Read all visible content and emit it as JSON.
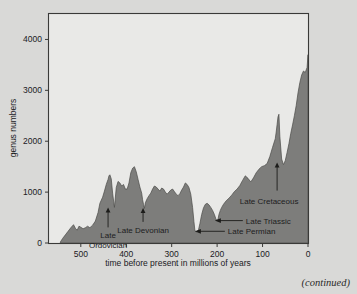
{
  "figure": {
    "caption_note": "(continued)",
    "background_color": "#d9d9d7",
    "plot_background_color": "#e9e9e7",
    "curve_fill_color": "#7d7d7b"
  },
  "chart_data": {
    "type": "area",
    "title": "",
    "xlabel": "time before present in millions of years",
    "ylabel": "genus numbers",
    "xlim": [
      570,
      0
    ],
    "ylim": [
      0,
      4500
    ],
    "x_reversed": true,
    "grid": false,
    "legend": null,
    "xticks": [
      500,
      400,
      300,
      200,
      100,
      0
    ],
    "xtick_labels": [
      "500",
      "400",
      "300",
      "200",
      "100",
      "0"
    ],
    "yticks": [
      0,
      1000,
      2000,
      3000,
      4000
    ],
    "ytick_labels": [
      "0",
      "1000",
      "2000",
      "3000",
      "4000"
    ],
    "series_name": "marine animal genus diversity",
    "x": [
      545,
      540,
      534,
      528,
      522,
      516,
      512,
      508,
      504,
      500,
      495,
      490,
      485,
      480,
      474,
      468,
      462,
      458,
      452,
      448,
      444,
      440,
      438,
      436,
      433,
      430,
      426,
      422,
      418,
      414,
      410,
      406,
      402,
      398,
      394,
      390,
      386,
      382,
      378,
      374,
      370,
      366,
      364,
      362,
      360,
      358,
      354,
      350,
      346,
      342,
      338,
      334,
      330,
      326,
      322,
      318,
      314,
      310,
      306,
      302,
      298,
      294,
      290,
      286,
      282,
      278,
      274,
      270,
      266,
      262,
      258,
      254,
      251,
      249,
      247,
      245,
      243,
      241,
      238,
      234,
      230,
      226,
      222,
      218,
      214,
      210,
      206,
      203,
      200,
      198,
      196,
      193,
      190,
      186,
      180,
      174,
      168,
      162,
      156,
      150,
      144,
      138,
      132,
      126,
      120,
      114,
      108,
      102,
      96,
      90,
      84,
      78,
      72,
      70,
      68,
      66,
      64,
      62,
      58,
      54,
      50,
      46,
      42,
      38,
      34,
      30,
      26,
      22,
      18,
      14,
      10,
      6,
      2,
      0
    ],
    "y": [
      20,
      90,
      160,
      230,
      300,
      360,
      290,
      250,
      330,
      310,
      280,
      300,
      330,
      300,
      350,
      430,
      600,
      780,
      900,
      1020,
      1150,
      1250,
      1320,
      1340,
      1260,
      980,
      700,
      1090,
      1210,
      1180,
      1120,
      1150,
      1060,
      1060,
      1180,
      1380,
      1470,
      1500,
      1400,
      1250,
      1100,
      980,
      850,
      760,
      680,
      790,
      870,
      930,
      980,
      1060,
      1120,
      1100,
      1060,
      1020,
      1080,
      1060,
      1000,
      960,
      1000,
      1040,
      1060,
      1010,
      960,
      930,
      970,
      1040,
      1100,
      1180,
      1150,
      1090,
      960,
      700,
      420,
      250,
      230,
      220,
      230,
      260,
      380,
      560,
      690,
      760,
      780,
      750,
      700,
      640,
      560,
      480,
      430,
      470,
      560,
      640,
      700,
      760,
      830,
      880,
      940,
      1010,
      1060,
      1130,
      1230,
      1320,
      1270,
      1200,
      1280,
      1380,
      1450,
      1500,
      1520,
      1560,
      1700,
      1880,
      2050,
      2180,
      2330,
      2480,
      2530,
      2100,
      1650,
      1540,
      1620,
      1780,
      1950,
      2150,
      2320,
      2500,
      2700,
      2950,
      3150,
      3300,
      3380,
      3350,
      3450,
      3700,
      3950,
      4150,
      4300
    ],
    "annotations": [
      {
        "id": "late-ordovician",
        "label": "Late Ordovician",
        "label_lines": [
          "Late",
          "Ordovician"
        ],
        "x_ma": 440,
        "y_value": 700,
        "arrow": "up"
      },
      {
        "id": "late-devonian",
        "label": "Late Devonian",
        "label_lines": [
          "Late Devonian"
        ],
        "x_ma": 363,
        "y_value": 690,
        "arrow": "up"
      },
      {
        "id": "late-permian",
        "label": "Late Permian",
        "label_lines": [
          "Late Permian"
        ],
        "x_ma": 249,
        "y_value": 230,
        "arrow": "left"
      },
      {
        "id": "late-triassic",
        "label": "Late Triassic",
        "label_lines": [
          "Late Triassic"
        ],
        "x_ma": 205,
        "y_value": 440,
        "arrow": "left"
      },
      {
        "id": "late-cretaceous",
        "label": "Late Cretaceous",
        "label_lines": [
          "Late Cretaceous"
        ],
        "x_ma": 68,
        "y_value": 1580,
        "arrow": "up"
      }
    ]
  }
}
